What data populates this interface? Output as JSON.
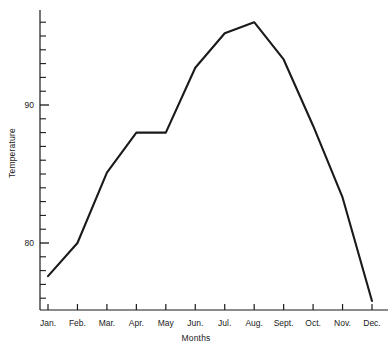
{
  "chart_data": {
    "type": "line",
    "title": "",
    "xlabel": "Months",
    "ylabel": "Temperature",
    "categories": [
      "Jan.",
      "Feb.",
      "Mar.",
      "Apr.",
      "May",
      "Jun.",
      "Jul.",
      "Aug.",
      "Sept.",
      "Oct.",
      "Nov.",
      "Dec."
    ],
    "values": [
      77.6,
      80.0,
      85.1,
      88.0,
      88.0,
      92.7,
      95.2,
      96.0,
      93.3,
      88.5,
      83.3,
      75.8
    ],
    "series": [
      {
        "name": "Temperature",
        "values": [
          77.6,
          80.0,
          85.1,
          88.0,
          88.0,
          92.7,
          95.2,
          96.0,
          93.3,
          88.5,
          83.3,
          75.8
        ]
      }
    ],
    "ylim": [
      75.0,
      97.0
    ],
    "y_major_ticks": [
      80,
      90
    ],
    "y_major_tick_labels": [
      "80",
      "90"
    ],
    "y_minor_tick_step": 1,
    "grid": false,
    "legend": false,
    "legend_position": "none",
    "line_color": "#1a1a1a",
    "line_width": 2.1,
    "markers": false,
    "background_color": "#ffffff"
  },
  "axes": {
    "x_axis_name": "x-axis",
    "y_axis_name": "y-axis"
  }
}
